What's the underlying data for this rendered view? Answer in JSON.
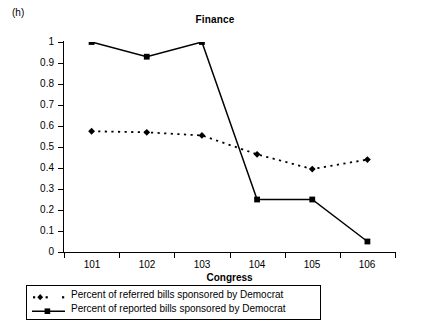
{
  "panel": {
    "label": "(h)"
  },
  "axis": {
    "y_ticks": [
      "1",
      "0.9",
      "0.8",
      "0.7",
      "0.6",
      "0.5",
      "0.4",
      "0.3",
      "0.2",
      "0.1",
      "0"
    ],
    "x_ticks": [
      "101",
      "102",
      "103",
      "104",
      "105",
      "106"
    ]
  },
  "legend": {
    "items": [
      {
        "label": "Percent of referred bills sponsored by Democrat",
        "marker": "diamond-marker",
        "line": "dotted"
      },
      {
        "label": "Percent of reported bills sponsored by Democrat",
        "marker": "square-marker",
        "line": "solid"
      }
    ]
  },
  "colors": {
    "line": "#000000",
    "background": "#ffffff",
    "axis": "#000000"
  },
  "chart_data": {
    "type": "line",
    "title": "Finance",
    "xlabel": "Congress",
    "ylabel": "",
    "categories": [
      "101",
      "102",
      "103",
      "104",
      "105",
      "106"
    ],
    "x": [
      101,
      102,
      103,
      104,
      105,
      106
    ],
    "ylim": [
      0,
      1
    ],
    "ytick_values": [
      0,
      0.1,
      0.2,
      0.3,
      0.4,
      0.5,
      0.6,
      0.7,
      0.8,
      0.9,
      1
    ],
    "grid": false,
    "legend_position": "below-plot",
    "series": [
      {
        "name": "Percent of referred bills sponsored by Democrat",
        "style": "dotted",
        "marker": "diamond",
        "values": [
          0.575,
          0.57,
          0.555,
          0.465,
          0.395,
          0.44
        ]
      },
      {
        "name": "Percent of reported bills sponsored by Democrat",
        "style": "solid",
        "marker": "square",
        "values": [
          1.0,
          0.93,
          1.0,
          0.25,
          0.25,
          0.05
        ]
      }
    ]
  }
}
